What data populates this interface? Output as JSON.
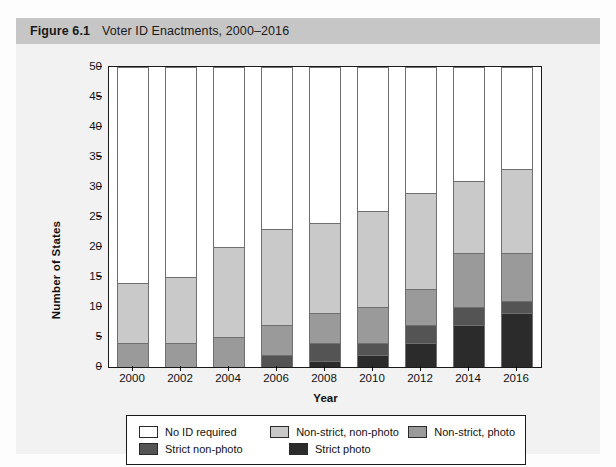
{
  "figure": {
    "number": "Figure 6.1",
    "title": "Voter ID Enactments, 2000–2016"
  },
  "chart_data": {
    "type": "bar",
    "stacked": true,
    "title": "Voter ID Enactments, 2000–2016",
    "xlabel": "Year",
    "ylabel": "Number of States",
    "ylim": [
      0,
      50
    ],
    "yticks": [
      0,
      5,
      10,
      15,
      20,
      25,
      30,
      35,
      40,
      45,
      50
    ],
    "grid": false,
    "legend_position": "bottom",
    "categories": [
      "2000",
      "2002",
      "2004",
      "2006",
      "2008",
      "2010",
      "2012",
      "2014",
      "2016"
    ],
    "series": [
      {
        "name": "Strict photo",
        "color": "#2b2b2b",
        "values": [
          0,
          0,
          0,
          0,
          1,
          2,
          4,
          7,
          9
        ]
      },
      {
        "name": "Strict non-photo",
        "color": "#545454",
        "values": [
          0,
          0,
          0,
          2,
          3,
          2,
          3,
          3,
          2
        ]
      },
      {
        "name": "Non-strict, photo",
        "color": "#9a9a9a",
        "values": [
          4,
          4,
          5,
          5,
          5,
          6,
          6,
          9,
          8
        ]
      },
      {
        "name": "Non-strict, non-photo",
        "color": "#c9c9c9",
        "values": [
          10,
          11,
          15,
          16,
          15,
          16,
          16,
          12,
          14
        ]
      },
      {
        "name": "No ID required",
        "color": "#ffffff",
        "values": [
          36,
          35,
          30,
          27,
          26,
          24,
          21,
          19,
          17
        ]
      }
    ],
    "cumulative_tops": {
      "strict_photo": [
        0,
        0,
        0,
        0,
        1,
        2,
        4,
        7,
        9
      ],
      "strict_non_photo": [
        0,
        0,
        0,
        2,
        4,
        4,
        7,
        10,
        11
      ],
      "non_strict_photo": [
        4,
        4,
        5,
        7,
        9,
        10,
        13,
        19,
        19
      ],
      "non_strict_non_photo": [
        14,
        15,
        20,
        23,
        24,
        26,
        29,
        31,
        33
      ],
      "no_id_required": [
        50,
        50,
        50,
        50,
        50,
        50,
        50,
        50,
        50
      ]
    }
  },
  "legend": {
    "items": [
      {
        "label": "No ID required",
        "color": "#ffffff"
      },
      {
        "label": "Non-strict, non-photo",
        "color": "#c9c9c9"
      },
      {
        "label": "Non-strict, photo",
        "color": "#9a9a9a"
      },
      {
        "label": "Strict non-photo",
        "color": "#545454"
      },
      {
        "label": "Strict photo",
        "color": "#2b2b2b"
      }
    ]
  }
}
